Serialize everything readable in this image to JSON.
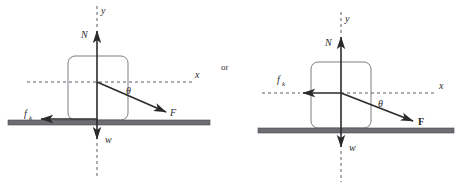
{
  "figure": {
    "connector_label": "or",
    "diagrams": [
      {
        "id": "left-diagram",
        "name": "free-body-diagram-force-below-horizontal-origin-at-center",
        "labels": {
          "y_axis": "y",
          "x_axis": "x",
          "normal_force": "N",
          "weight": "w",
          "friction": "f",
          "friction_subscript": "k",
          "applied_force": "F",
          "angle": "θ"
        },
        "vectors": [
          {
            "name": "normal-force-vector",
            "symbol": "N",
            "direction": "up",
            "from": [
              97,
              103
            ],
            "to": [
              97,
              29
            ]
          },
          {
            "name": "weight-vector",
            "symbol": "w",
            "direction": "down",
            "from": [
              97,
              103
            ],
            "to": [
              97,
              141
            ]
          },
          {
            "name": "friction-vector",
            "symbol": "f_k",
            "direction": "left",
            "from": [
              97,
              119
            ],
            "to": [
              39,
              119
            ]
          },
          {
            "name": "applied-force-vector",
            "symbol": "F",
            "direction": "down-right",
            "from": [
              97,
              82
            ],
            "to": [
              168,
              113
            ]
          }
        ],
        "angle_value_degrees": 24,
        "block": {
          "x": 68,
          "y": 56,
          "width": 60,
          "height": 64
        },
        "ground": {
          "x": 8,
          "y": 120,
          "width": 202,
          "height": 5
        }
      },
      {
        "id": "right-diagram",
        "name": "free-body-diagram-force-below-horizontal-friction-along-x-axis",
        "labels": {
          "y_axis": "y",
          "x_axis": "x",
          "normal_force": "N",
          "weight": "w",
          "friction": "f",
          "friction_subscript": "k",
          "applied_force": "F",
          "angle": "θ"
        },
        "vectors": [
          {
            "name": "normal-force-vector",
            "symbol": "N",
            "direction": "up",
            "from": [
              341,
              93
            ],
            "to": [
              341,
              35
            ]
          },
          {
            "name": "weight-vector",
            "symbol": "w",
            "direction": "down",
            "from": [
              341,
              93
            ],
            "to": [
              341,
              149
            ]
          },
          {
            "name": "friction-vector",
            "symbol": "f_k",
            "direction": "left",
            "from": [
              341,
              93
            ],
            "to": [
              301,
              93
            ]
          },
          {
            "name": "applied-force-vector",
            "symbol": "F",
            "direction": "down-right",
            "from": [
              341,
              93
            ],
            "to": [
              415,
              122
            ]
          }
        ],
        "angle_value_degrees": 21,
        "block": {
          "x": 311,
          "y": 62,
          "width": 60,
          "height": 66
        },
        "ground": {
          "x": 258,
          "y": 128,
          "width": 196,
          "height": 5
        }
      }
    ]
  }
}
